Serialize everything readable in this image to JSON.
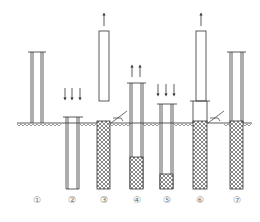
{
  "diagram": {
    "type": "construction-process-sequence",
    "colors": {
      "line": "#333333",
      "fill_hatch": "#555555",
      "label": "#777777",
      "background": "#ffffff"
    },
    "steps": [
      {
        "id": 1,
        "label": "①",
        "description": "Casing pipe positioned above ground",
        "arrows": "none"
      },
      {
        "id": 2,
        "label": "②",
        "description": "Casing pipe driven into ground",
        "arrows": "down"
      },
      {
        "id": 3,
        "label": "③",
        "description": "Core withdrawn, hole filled via hopper",
        "arrows": "up"
      },
      {
        "id": 4,
        "label": "④",
        "description": "Casing lifted with partial fill",
        "arrows": "up"
      },
      {
        "id": 5,
        "label": "⑤",
        "description": "Casing driven down to compact fill",
        "arrows": "down"
      },
      {
        "id": 6,
        "label": "⑥",
        "description": "Core withdrawn, filling via hopper",
        "arrows": "up"
      },
      {
        "id": 7,
        "label": "⑦",
        "description": "Completed filled column",
        "arrows": "none"
      }
    ]
  }
}
